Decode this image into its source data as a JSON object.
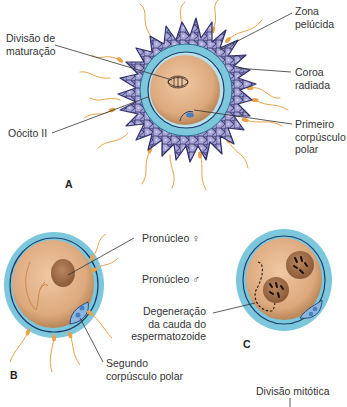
{
  "figure": {
    "colors": {
      "cytoplasm": "#e4b68f",
      "cytoplasm_edge": "#b98659",
      "zona_pellucida": "#7cc7dc",
      "membrane": "#1e3f6a",
      "corona_cells": "#8f8ec6",
      "corona_outline": "#2f2f6a",
      "sperm": "#e8a24a",
      "pronucleus": "#a56f48",
      "polar_body": "#4a7fc1",
      "leader": "#333333"
    },
    "panels": [
      {
        "id": "A",
        "letter": "A",
        "labels": {
          "divisao_maturacao": "Divisão de\nmaturação",
          "oocito": "Oócito II",
          "zona_pelucida": "Zona\npelúcida",
          "coroa_radiada": "Coroa\nradiada",
          "primeiro_corpusculo": "Primeiro\ncorpúsculo\npolar"
        }
      },
      {
        "id": "B",
        "letter": "B",
        "labels": {
          "pronucleo_feminino": "Pronúcleo ♀",
          "segundo_corpusculo": "Segundo\ncorpúsculo polar"
        }
      },
      {
        "id": "C",
        "letter": "C",
        "labels": {
          "pronucleo_masculino": "Pronúcleo ♂",
          "degeneracao": "Degeneração\nda cauda do\nespermatozoide"
        }
      },
      {
        "id": "D",
        "labels": {
          "divisao_mitotica": "Divisão mitótica"
        }
      }
    ]
  }
}
